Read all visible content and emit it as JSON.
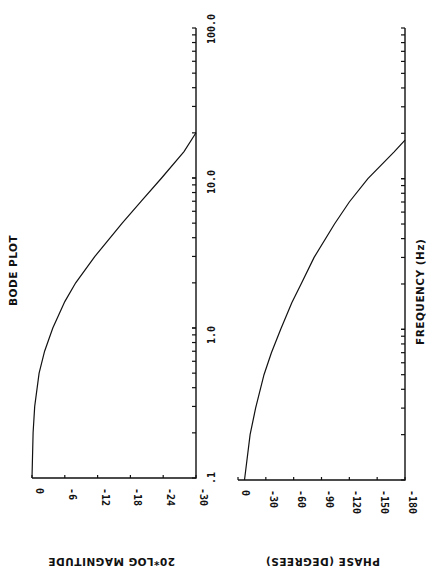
{
  "chart_data": [
    {
      "type": "line",
      "title": "BODE PLOT",
      "xlabel": "FREQUENCY (Hz)",
      "ylabel": "20*LOG MAGNITUDE",
      "xscale": "log",
      "xlim": [
        0.1,
        100.0
      ],
      "ylim": [
        -30,
        0
      ],
      "x_tick_labels": [
        ".1",
        "1.0",
        "10.0",
        "100.0"
      ],
      "y_ticks": [
        0,
        -6,
        -12,
        -18,
        -24,
        -30
      ],
      "y_tick_labels": [
        "0",
        "-6",
        "-12",
        "-18",
        "-24",
        "-30"
      ],
      "grid": false,
      "orientation": "rotated 90 degrees counter-clockwise",
      "series": [
        {
          "name": "magnitude",
          "x": [
            0.1,
            0.2,
            0.3,
            0.5,
            0.7,
            1.0,
            1.5,
            2.0,
            3.0,
            5.0,
            7.0,
            10.0,
            15.0,
            20.0
          ],
          "values": [
            0,
            -0.2,
            -0.5,
            -1.3,
            -2.3,
            -3.8,
            -6.0,
            -8.0,
            -11.5,
            -16.5,
            -20.0,
            -23.7,
            -27.8,
            -30.0
          ]
        }
      ]
    },
    {
      "type": "line",
      "xlabel": "FREQUENCY (Hz)",
      "ylabel": "PHASE (DEGREES)",
      "xscale": "log",
      "xlim": [
        0.1,
        100.0
      ],
      "ylim": [
        -180,
        0
      ],
      "y_ticks": [
        0,
        -30,
        -60,
        -90,
        -120,
        -150,
        -180
      ],
      "y_tick_labels": [
        "0",
        "-30",
        "-60",
        "-90",
        "-120",
        "-150",
        "-180"
      ],
      "grid": false,
      "orientation": "rotated 90 degrees counter-clockwise",
      "series": [
        {
          "name": "phase",
          "x": [
            0.1,
            0.2,
            0.3,
            0.5,
            0.7,
            1.0,
            1.5,
            2.0,
            3.0,
            5.0,
            7.0,
            10.0,
            15.0,
            18.0
          ],
          "values": [
            -7,
            -13,
            -19,
            -28,
            -36,
            -46,
            -58,
            -68,
            -82,
            -104,
            -120,
            -140,
            -168,
            -180
          ]
        }
      ]
    }
  ],
  "labels": {
    "title": "BODE PLOT",
    "frequency_axis": "FREQUENCY    (Hz)",
    "magnitude_axis": "20*LOG MAGNITUDE",
    "phase_axis": "PHASE (DEGREES)",
    "freq_ticks": [
      ".1",
      "1.0",
      "10.0",
      "100.0"
    ],
    "mag_ticks": [
      "0",
      "-6",
      "-12",
      "-18",
      "-24",
      "-30"
    ],
    "phase_ticks": [
      "0",
      "-30",
      "-60",
      "-90",
      "-120",
      "-150",
      "-180"
    ]
  }
}
